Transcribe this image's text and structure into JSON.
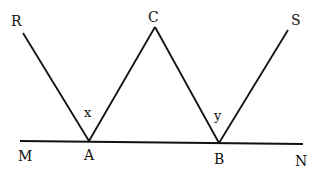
{
  "diagram": {
    "points": {
      "R": {
        "label": "R"
      },
      "C": {
        "label": "C"
      },
      "S": {
        "label": "S"
      },
      "M": {
        "label": "M"
      },
      "A": {
        "label": "A"
      },
      "B": {
        "label": "B"
      },
      "N": {
        "label": "N"
      }
    },
    "angles": {
      "x": {
        "label": "x"
      },
      "y": {
        "label": "y"
      }
    },
    "segments": [
      "RA",
      "AC",
      "CB",
      "BS",
      "MN"
    ]
  }
}
